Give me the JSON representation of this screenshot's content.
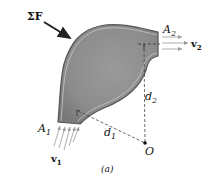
{
  "figure": {
    "caption": "(a)",
    "force_label": "ΣF",
    "inlet": {
      "area_label": "A",
      "area_sub": "1",
      "velocity_label": "v",
      "velocity_sub": "1"
    },
    "outlet": {
      "area_label": "A",
      "area_sub": "2",
      "velocity_label": "v",
      "velocity_sub": "2"
    },
    "distances": [
      {
        "label": "d",
        "sub": "1"
      },
      {
        "label": "d",
        "sub": "2"
      }
    ],
    "point_label": "O",
    "colors": {
      "fluid_fill": "#8a8a8a",
      "wall": "#555555",
      "background": "#ffffff"
    }
  }
}
